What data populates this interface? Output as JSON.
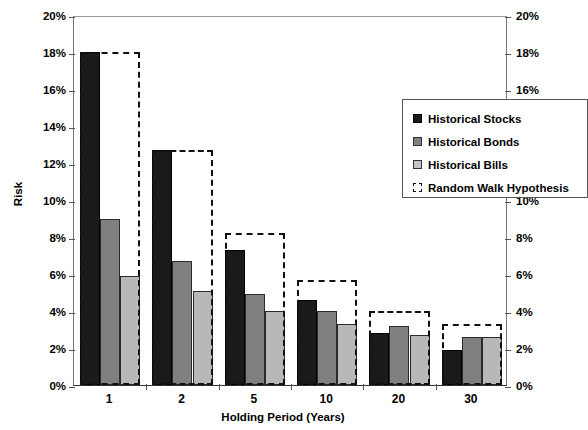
{
  "chart_data": {
    "type": "bar",
    "title": "",
    "xlabel": "Holding Period (Years)",
    "ylabel": "Risk",
    "categories": [
      "1",
      "2",
      "5",
      "10",
      "20",
      "30"
    ],
    "ylim": [
      0,
      20
    ],
    "ytick_labels": [
      "0%",
      "2%",
      "4%",
      "6%",
      "8%",
      "10%",
      "12%",
      "14%",
      "16%",
      "18%",
      "20%"
    ],
    "ytick_values": [
      0,
      2,
      4,
      6,
      8,
      10,
      12,
      14,
      16,
      18,
      20
    ],
    "right_axis": true,
    "right_ytick_labels": [
      "0%",
      "2%",
      "4%",
      "6%",
      "8%",
      "10%",
      "12%",
      "14%",
      "16%",
      "18%",
      "20%"
    ],
    "grid": false,
    "legend_position": "upper-right-inside",
    "series": [
      {
        "name": "Historical Stocks",
        "color": "#1a1a1a",
        "style": "filled",
        "values": [
          18.0,
          12.7,
          7.3,
          4.6,
          2.8,
          1.9
        ]
      },
      {
        "name": "Historical Bonds",
        "color": "#808080",
        "style": "filled",
        "values": [
          9.0,
          6.7,
          4.9,
          4.0,
          3.2,
          2.6
        ]
      },
      {
        "name": "Historical Bills",
        "color": "#b8b8b8",
        "style": "filled",
        "values": [
          5.9,
          5.1,
          4.0,
          3.3,
          2.7,
          2.6
        ]
      },
      {
        "name": "Random Walk Hypothesis",
        "color": "#111111",
        "style": "dashed-outline",
        "values": [
          18.0,
          12.7,
          8.2,
          5.7,
          4.0,
          3.3
        ]
      }
    ]
  },
  "axis": {
    "y_title": "Risk",
    "x_title": "Holding Period (Years)"
  },
  "legend": {
    "items": [
      {
        "label": "Historical Stocks"
      },
      {
        "label": "Historical Bonds"
      },
      {
        "label": "Historical Bills"
      },
      {
        "label": "Random Walk Hypothesis"
      }
    ]
  }
}
